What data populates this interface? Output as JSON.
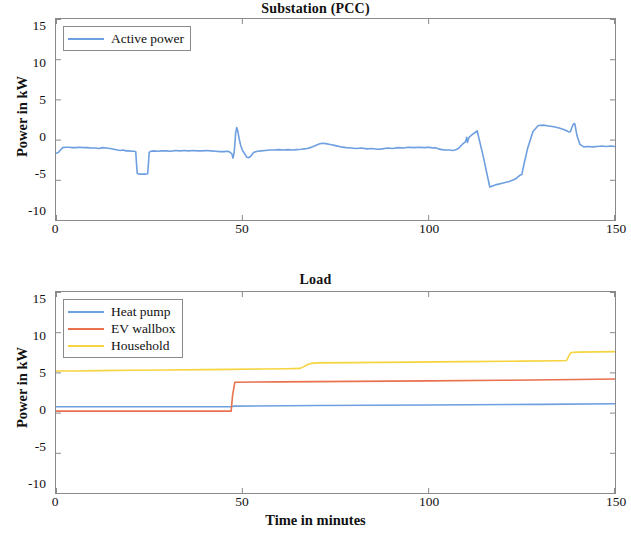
{
  "figure": {
    "xlabel": "Time in minutes",
    "bg_color": "#ffffff",
    "axis_color": "#8a8a8a"
  },
  "colors": {
    "active_power": "#6e9fe0",
    "heat_pump": "#6e9fe0",
    "ev_wallbox": "#e8714e",
    "household": "#f6d43f"
  },
  "panels": {
    "top": {
      "title": "Substation (PCC)",
      "ylabel": "Power in kW",
      "yticks": [
        "15",
        "10",
        "5",
        "0",
        "-5",
        "-10"
      ],
      "xticks": [
        "0",
        "50",
        "100",
        "150"
      ],
      "legend": [
        {
          "label": "Active power",
          "color_key": "active_power"
        }
      ]
    },
    "bottom": {
      "title": "Load",
      "ylabel": "Power in kW",
      "yticks": [
        "15",
        "10",
        "5",
        "0",
        "-5",
        "-10"
      ],
      "xticks": [
        "0",
        "50",
        "100",
        "150"
      ],
      "legend": [
        {
          "label": "Heat pump",
          "color_key": "heat_pump"
        },
        {
          "label": "EV wallbox",
          "color_key": "ev_wallbox"
        },
        {
          "label": "Household",
          "color_key": "household"
        }
      ]
    }
  },
  "chart_data": [
    {
      "type": "line",
      "title": "Substation (PCC)",
      "xlabel": "",
      "ylabel": "Power in kW",
      "xlim": [
        0,
        150
      ],
      "ylim": [
        -10,
        15
      ],
      "yticks": [
        -10,
        -5,
        0,
        5,
        10,
        15
      ],
      "xticks": [
        0,
        50,
        100,
        150
      ],
      "grid": false,
      "legend_position": "top-left",
      "series": [
        {
          "name": "Active power",
          "color": "#6e9fe0",
          "x": [
            0,
            0.6,
            1.2,
            1.8,
            2.6,
            3.4,
            4.4,
            5.4,
            6.4,
            7.5,
            8.5,
            9.5,
            10.5,
            11.5,
            12.5,
            13.5,
            14.5,
            15.5,
            16.5,
            17.2,
            18.0,
            18.8,
            19.6,
            20.3,
            21.0,
            21.4,
            21.6,
            21.8,
            22.2,
            23.0,
            24.0,
            24.6,
            24.8,
            25.0,
            25.4,
            26.2,
            27.2,
            28.4,
            29.6,
            30.8,
            32.0,
            33.2,
            34.4,
            35.6,
            36.8,
            38.0,
            39.2,
            40.4,
            41.6,
            42.8,
            44.0,
            45.2,
            45.8,
            46.4,
            46.8,
            47.2,
            47.5,
            47.8,
            48.0,
            48.2,
            48.5,
            48.8,
            49.2,
            49.6,
            50.0,
            50.4,
            50.8,
            51.2,
            51.6,
            52.2,
            53.0,
            54.0,
            55.0,
            56.2,
            57.4,
            58.6,
            59.8,
            61.0,
            62.2,
            63.4,
            64.6,
            65.8,
            66.6,
            67.4,
            68.2,
            69.0,
            69.8,
            70.6,
            71.4,
            72.4,
            73.6,
            75.0,
            76.4,
            77.8,
            79.2,
            80.6,
            82.0,
            83.4,
            84.8,
            86.2,
            87.6,
            89.0,
            90.4,
            91.8,
            93.2,
            94.6,
            96.0,
            97.4,
            98.8,
            100.0,
            100.6,
            101.2,
            101.8,
            102.6,
            103.6,
            104.6,
            105.6,
            106.4,
            107.0,
            107.6,
            108.2,
            108.6,
            109.0,
            109.4,
            109.8,
            110.0,
            110.2,
            110.4,
            110.8,
            111.6,
            113.0,
            114.6,
            116.4,
            118.2,
            120.0,
            121.6,
            122.8,
            123.6,
            124.0,
            124.3,
            124.6,
            125.0,
            125.6,
            126.6,
            128.0,
            129.4,
            130.8,
            132.2,
            133.6,
            135.0,
            136.0,
            136.6,
            137.0,
            137.4,
            137.8,
            138.0,
            138.2,
            138.5,
            138.8,
            139.2,
            139.8,
            140.6,
            141.6,
            142.8,
            144.0,
            145.2,
            146.4,
            147.6,
            148.8,
            150.0
          ],
          "y": [
            -1.7,
            -1.6,
            -1.3,
            -1.0,
            -0.95,
            -0.95,
            -1.0,
            -1.0,
            -0.95,
            -1.0,
            -1.0,
            -1.05,
            -1.05,
            -1.1,
            -1.0,
            -1.05,
            -1.1,
            -1.2,
            -1.3,
            -1.35,
            -1.3,
            -1.4,
            -1.4,
            -1.45,
            -1.45,
            -1.5,
            -3.0,
            -4.2,
            -4.3,
            -4.3,
            -4.3,
            -4.25,
            -3.0,
            -1.6,
            -1.45,
            -1.4,
            -1.45,
            -1.4,
            -1.4,
            -1.45,
            -1.35,
            -1.4,
            -1.35,
            -1.4,
            -1.35,
            -1.4,
            -1.4,
            -1.35,
            -1.4,
            -1.45,
            -1.5,
            -1.5,
            -1.45,
            -1.5,
            -1.6,
            -1.8,
            -2.3,
            -1.6,
            -0.6,
            0.8,
            1.5,
            1.0,
            0.0,
            -0.8,
            -1.3,
            -1.6,
            -1.9,
            -2.2,
            -2.25,
            -2.1,
            -1.6,
            -1.45,
            -1.4,
            -1.35,
            -1.3,
            -1.3,
            -1.25,
            -1.3,
            -1.25,
            -1.3,
            -1.25,
            -1.2,
            -1.15,
            -1.1,
            -1.0,
            -0.85,
            -0.7,
            -0.55,
            -0.45,
            -0.5,
            -0.6,
            -0.75,
            -0.9,
            -1.0,
            -1.05,
            -1.1,
            -1.05,
            -1.15,
            -1.1,
            -1.2,
            -1.15,
            -1.05,
            -1.1,
            -1.0,
            -1.05,
            -0.95,
            -1.0,
            -0.95,
            -1.0,
            -0.95,
            -1.0,
            -1.05,
            -1.0,
            -1.15,
            -1.25,
            -1.3,
            -1.3,
            -1.35,
            -1.3,
            -1.2,
            -1.0,
            -0.8,
            -0.6,
            -0.45,
            -0.3,
            -0.1,
            0.3,
            -0.35,
            0.25,
            0.6,
            1.1,
            -2.0,
            -5.9,
            -5.6,
            -5.4,
            -5.2,
            -5.0,
            -4.8,
            -4.6,
            -4.5,
            -4.4,
            -4.35,
            -3.0,
            -1.0,
            1.0,
            1.75,
            1.8,
            1.7,
            1.6,
            1.45,
            1.3,
            1.2,
            1.1,
            1.0,
            0.95,
            1.0,
            1.2,
            1.6,
            1.9,
            2.0,
            0.5,
            -0.6,
            -0.9,
            -0.85,
            -0.9,
            -0.85,
            -0.8,
            -0.85,
            -0.8,
            -0.85,
            -0.8,
            -0.7
          ]
        }
      ]
    },
    {
      "type": "line",
      "title": "Load",
      "xlabel": "Time in minutes",
      "ylabel": "Power in kW",
      "xlim": [
        0,
        150
      ],
      "ylim": [
        -10,
        15
      ],
      "yticks": [
        -10,
        -5,
        0,
        5,
        10,
        15
      ],
      "xticks": [
        0,
        50,
        100,
        150
      ],
      "grid": false,
      "legend_position": "top-left",
      "series": [
        {
          "name": "Heat pump",
          "color": "#6e9fe0",
          "x": [
            0,
            30,
            47.0,
            47.6,
            70,
            100,
            130,
            150
          ],
          "y": [
            0.72,
            0.72,
            0.72,
            0.8,
            0.88,
            0.95,
            1.02,
            1.1
          ]
        },
        {
          "name": "EV wallbox",
          "color": "#e8714e",
          "x": [
            0,
            20,
            40,
            47.0,
            47.4,
            48.0,
            60,
            80,
            100,
            120,
            140,
            150
          ],
          "y": [
            0.18,
            0.18,
            0.18,
            0.18,
            2.2,
            3.78,
            3.82,
            3.88,
            3.95,
            4.02,
            4.12,
            4.18
          ]
        },
        {
          "name": "Household",
          "color": "#f6d43f",
          "x": [
            0,
            5,
            12,
            20,
            30,
            40,
            47,
            55,
            62,
            65.5,
            66.5,
            67.5,
            68.5,
            70,
            80,
            95,
            110,
            125,
            135,
            137.0,
            137.6,
            138.2,
            140,
            145,
            150
          ],
          "y": [
            5.18,
            5.18,
            5.22,
            5.26,
            5.3,
            5.34,
            5.38,
            5.42,
            5.46,
            5.5,
            5.72,
            5.98,
            6.12,
            6.18,
            6.22,
            6.28,
            6.34,
            6.4,
            6.45,
            6.48,
            7.05,
            7.48,
            7.52,
            7.55,
            7.58
          ]
        }
      ]
    }
  ]
}
